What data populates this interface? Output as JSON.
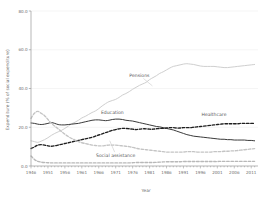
{
  "chart_data": {
    "type": "line",
    "title": "",
    "xlabel": "Year",
    "ylabel": "Expenditure (% of social expenditure)",
    "xlim": [
      1946,
      2013
    ],
    "ylim": [
      0,
      80
    ],
    "grid": true,
    "legend_position": "inline-annotations",
    "y_ticks": [
      "0.0",
      "20.0",
      "40.0",
      "60.0",
      "80.0"
    ],
    "y_tick_values": [
      0,
      20,
      40,
      60,
      80
    ],
    "x_ticks": [
      "1946",
      "1951",
      "1956",
      "1961",
      "1966",
      "1971",
      "1976",
      "1981",
      "1986",
      "1991",
      "1996",
      "2001",
      "2006",
      "2011"
    ],
    "x_tick_values": [
      1946,
      1951,
      1956,
      1961,
      1966,
      1971,
      1976,
      1981,
      1986,
      1991,
      1996,
      2001,
      2006,
      2011
    ],
    "x": [
      1946,
      1947,
      1948,
      1949,
      1950,
      1951,
      1952,
      1953,
      1954,
      1955,
      1956,
      1957,
      1958,
      1959,
      1960,
      1961,
      1962,
      1963,
      1964,
      1965,
      1966,
      1967,
      1968,
      1969,
      1970,
      1971,
      1972,
      1973,
      1974,
      1975,
      1976,
      1977,
      1978,
      1979,
      1980,
      1981,
      1982,
      1983,
      1984,
      1985,
      1986,
      1987,
      1988,
      1989,
      1990,
      1991,
      1992,
      1993,
      1994,
      1995,
      1996,
      1997,
      1998,
      1999,
      2000,
      2001,
      2002,
      2003,
      2004,
      2005,
      2006,
      2007,
      2008,
      2009,
      2010,
      2011,
      2012
    ],
    "series": [
      {
        "name": "Pensions",
        "style": "solid",
        "color": "#cfcfcf",
        "label_x": 1978,
        "label_y": 46,
        "values": [
          13.0,
          12.6,
          12.2,
          12.8,
          13.6,
          14.6,
          15.8,
          16.8,
          17.6,
          18.4,
          19.4,
          20.6,
          21.8,
          22.6,
          23.6,
          24.8,
          25.6,
          26.6,
          27.6,
          28.4,
          29.6,
          31.0,
          32.2,
          33.2,
          33.8,
          34.4,
          35.4,
          36.6,
          37.4,
          38.4,
          39.6,
          40.6,
          41.6,
          42.4,
          43.2,
          44.6,
          45.6,
          46.6,
          47.8,
          48.6,
          49.6,
          50.6,
          51.4,
          51.8,
          52.2,
          52.6,
          52.8,
          52.6,
          52.4,
          52.0,
          51.6,
          51.4,
          51.4,
          51.4,
          51.4,
          51.2,
          51.0,
          50.8,
          50.8,
          51.0,
          51.2,
          51.4,
          51.6,
          51.8,
          52.0,
          52.2,
          52.4
        ]
      },
      {
        "name": "Education",
        "style": "solid",
        "color": "#3a3a3a",
        "label_x": 1970,
        "label_y": 27,
        "values": [
          22.2,
          22.0,
          21.6,
          21.4,
          21.6,
          22.0,
          22.4,
          22.0,
          21.4,
          21.2,
          21.2,
          21.4,
          21.6,
          21.8,
          22.0,
          22.4,
          22.8,
          23.2,
          23.6,
          23.8,
          23.8,
          23.6,
          23.4,
          23.6,
          24.0,
          24.2,
          24.2,
          24.0,
          23.6,
          23.4,
          23.2,
          22.8,
          22.4,
          22.0,
          21.6,
          21.2,
          20.8,
          20.4,
          20.2,
          19.8,
          19.4,
          19.0,
          18.6,
          18.0,
          17.4,
          16.8,
          16.2,
          15.8,
          15.4,
          15.2,
          15.0,
          14.8,
          14.6,
          14.4,
          14.2,
          14.0,
          13.8,
          13.8,
          13.6,
          13.6,
          13.4,
          13.4,
          13.4,
          13.4,
          13.2,
          13.2,
          13.0
        ]
      },
      {
        "name": "Healthcare",
        "style": "dashed",
        "color": "#1e1e1e",
        "label_x": 2000,
        "label_y": 26,
        "values": [
          9.0,
          9.8,
          10.8,
          11.0,
          10.8,
          10.4,
          10.2,
          10.4,
          10.8,
          11.2,
          11.6,
          12.0,
          12.4,
          12.8,
          13.2,
          13.6,
          14.0,
          14.4,
          14.8,
          15.4,
          16.0,
          16.6,
          17.2,
          17.8,
          18.4,
          18.8,
          19.2,
          19.4,
          19.4,
          19.2,
          19.0,
          18.8,
          19.0,
          19.2,
          19.2,
          19.0,
          19.0,
          19.2,
          19.4,
          19.4,
          19.6,
          19.8,
          19.8,
          19.6,
          19.6,
          19.8,
          19.8,
          19.8,
          20.0,
          20.2,
          20.4,
          20.6,
          20.8,
          21.0,
          21.2,
          21.4,
          21.6,
          21.8,
          21.8,
          21.8,
          21.8,
          21.8,
          22.0,
          22.0,
          22.0,
          22.0,
          22.0
        ]
      },
      {
        "name": "Social assistance",
        "style": "dashed",
        "color": "#c4c4c4",
        "label_x": 1971,
        "label_y": 4.8,
        "values": [
          24.6,
          27.2,
          28.2,
          27.2,
          26.0,
          24.0,
          22.0,
          20.6,
          19.2,
          17.8,
          16.4,
          15.2,
          14.2,
          13.4,
          12.6,
          12.0,
          11.6,
          11.2,
          10.8,
          10.6,
          10.4,
          10.4,
          10.6,
          10.8,
          10.8,
          10.8,
          10.6,
          10.4,
          10.2,
          10.0,
          9.6,
          9.2,
          8.8,
          8.6,
          8.4,
          8.2,
          8.0,
          7.8,
          7.6,
          7.4,
          7.2,
          7.2,
          7.2,
          7.2,
          7.2,
          7.2,
          7.4,
          7.4,
          7.4,
          7.2,
          7.2,
          7.2,
          7.2,
          7.2,
          7.4,
          7.4,
          7.4,
          7.6,
          7.6,
          7.8,
          7.8,
          8.0,
          8.2,
          8.4,
          8.6,
          8.8,
          9.0
        ]
      },
      {
        "name": "Other",
        "style": "dashed",
        "color": "#b8b8b8",
        "label_x": null,
        "label_y": null,
        "values": [
          5.2,
          3.4,
          2.4,
          2.0,
          1.8,
          1.7,
          1.6,
          1.6,
          1.6,
          1.6,
          1.6,
          1.6,
          1.6,
          1.6,
          1.6,
          1.6,
          1.6,
          1.6,
          1.6,
          1.6,
          1.6,
          1.6,
          1.6,
          1.6,
          1.6,
          1.6,
          1.6,
          1.6,
          1.6,
          1.6,
          1.7,
          1.8,
          1.8,
          1.8,
          1.8,
          1.8,
          1.8,
          1.9,
          2.0,
          2.1,
          2.2,
          2.2,
          2.2,
          2.2,
          2.2,
          2.3,
          2.3,
          2.3,
          2.3,
          2.3,
          2.3,
          2.3,
          2.3,
          2.3,
          2.3,
          2.3,
          2.4,
          2.4,
          2.4,
          2.4,
          2.4,
          2.4,
          2.4,
          2.4,
          2.4,
          2.4,
          2.4
        ]
      }
    ],
    "annotations": [
      {
        "text": "Pensions",
        "leader": true
      },
      {
        "text": "Education",
        "leader": false
      },
      {
        "text": "Healthcare",
        "leader": false
      },
      {
        "text": "Social assistance",
        "leader": true
      }
    ]
  }
}
